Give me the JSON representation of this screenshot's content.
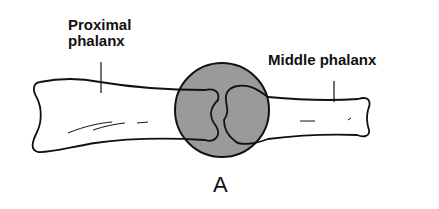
{
  "diagram": {
    "labels": {
      "proximal_line1": "Proximal",
      "proximal_line2": "phalanx",
      "middle": "Middle phalanx",
      "figure_letter": "A"
    },
    "colors": {
      "joint_fill": "#9a9a9a",
      "outline": "#111111",
      "background": "#ffffff"
    }
  }
}
